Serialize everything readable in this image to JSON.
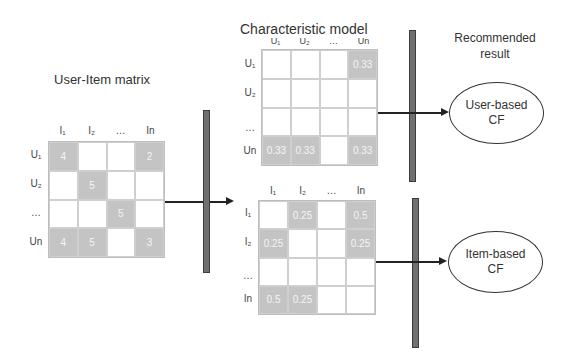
{
  "titles": {
    "user_item": "User-Item matrix",
    "characteristic": "Characteristic model",
    "recommended_line1": "Recommended",
    "recommended_line2": "result"
  },
  "user_item_matrix": {
    "col_headers": [
      "I₁",
      "I₂",
      "…",
      "In"
    ],
    "row_headers": [
      "U₁",
      "U₂",
      "…",
      "Un"
    ],
    "cells": [
      [
        "4",
        "",
        "",
        "2"
      ],
      [
        "",
        "5",
        "",
        ""
      ],
      [
        "",
        "",
        "5",
        ""
      ],
      [
        "4",
        "5",
        "",
        "3"
      ]
    ]
  },
  "user_model_matrix": {
    "col_headers": [
      "U₁",
      "U₂",
      "…",
      "Un"
    ],
    "row_headers": [
      "U₁",
      "U₂",
      "…",
      "Un"
    ],
    "cells": [
      [
        "",
        "",
        "",
        "0.33"
      ],
      [
        "",
        "",
        "",
        ""
      ],
      [
        "",
        "",
        "",
        ""
      ],
      [
        "0.33",
        "0.33",
        "",
        "0.33"
      ]
    ]
  },
  "item_model_matrix": {
    "col_headers": [
      "I₁",
      "I₂",
      "…",
      "In"
    ],
    "row_headers": [
      "I₁",
      "I₂",
      "…",
      "In"
    ],
    "cells": [
      [
        "",
        "0.25",
        "",
        "0.5"
      ],
      [
        "0.25",
        "",
        "",
        "0.25"
      ],
      [
        "",
        "",
        "",
        ""
      ],
      [
        "0.5",
        "0.25",
        "",
        ""
      ]
    ]
  },
  "results": {
    "user_based": {
      "line1": "User-based",
      "line2": "CF"
    },
    "item_based": {
      "line1": "Item-based",
      "line2": "CF"
    }
  },
  "colors": {
    "filled_cell": "#c4c4c4",
    "bar": "#707070",
    "grid": "#cfcfcf"
  }
}
